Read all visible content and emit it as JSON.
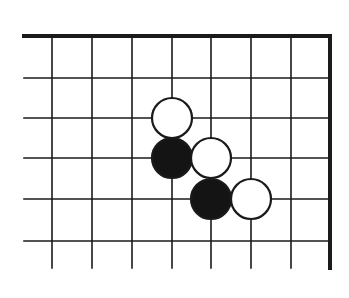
{
  "diagram": {
    "type": "go-board-fragment",
    "colors": {
      "background": "#ffffff",
      "line": "#1a1a1a",
      "black_stone": "#141414",
      "white_stone": "#ffffff"
    },
    "grid": {
      "columns_x": [
        52,
        92,
        132,
        172,
        211,
        251,
        291,
        330
      ],
      "rows_y": [
        36,
        78,
        118,
        158,
        199,
        241
      ],
      "left_open_x": 24,
      "bottom_open_y": 268,
      "top_edge": true,
      "right_edge": true
    },
    "stone_radius": 20,
    "stones": [
      {
        "color": "white",
        "col": 3,
        "row": 2
      },
      {
        "color": "black",
        "col": 3,
        "row": 3
      },
      {
        "color": "white",
        "col": 4,
        "row": 3
      },
      {
        "color": "black",
        "col": 4,
        "row": 4
      },
      {
        "color": "white",
        "col": 5,
        "row": 4
      }
    ]
  }
}
